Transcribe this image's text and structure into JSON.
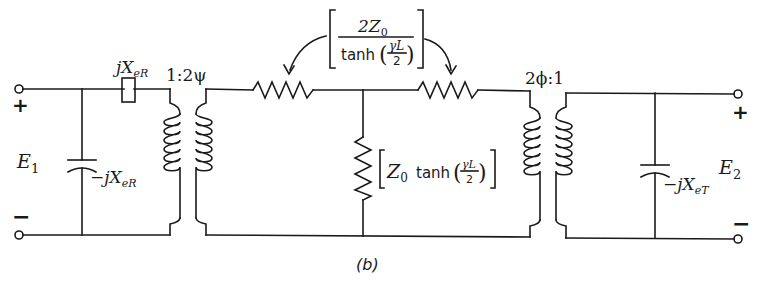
{
  "figure": {
    "caption": "(b)",
    "labels": {
      "input_voltage": {
        "main": "E",
        "sub": "1"
      },
      "output_voltage": {
        "main": "E",
        "sub": "2"
      },
      "input_plus": "+",
      "input_minus": "−",
      "output_plus": "+",
      "output_minus": "−",
      "series_reactance": {
        "prefix": "j",
        "main": "X",
        "sub": "eR"
      },
      "input_shunt_reactance": {
        "prefix": "−j",
        "main": "X",
        "sub": "eR"
      },
      "output_shunt_reactance": {
        "prefix": "−j",
        "main": "X",
        "sub": "eT"
      },
      "transformer_left_ratio": "1:2ψ",
      "transformer_right_ratio": "2ϕ:1",
      "series_arm": {
        "numerator": "2Z",
        "numerator_sub": "0",
        "func": "tanh",
        "arg_num": "γL",
        "arg_den": "2"
      },
      "shunt_arm": {
        "main": "Z",
        "sub": "0",
        "func": "tanh",
        "arg_num": "γL",
        "arg_den": "2"
      }
    },
    "colors": {
      "ink": "#1a1a1a",
      "background": "#ffffff"
    }
  }
}
